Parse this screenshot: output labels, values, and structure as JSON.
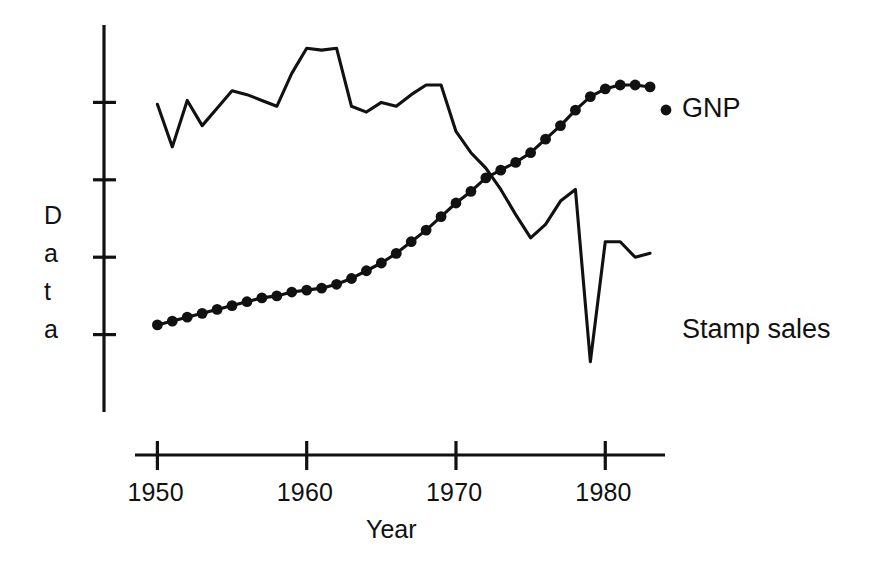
{
  "chart_data": {
    "type": "line",
    "title": "",
    "xlabel": "Year",
    "ylabel": "Data",
    "ylabel_letters": [
      "D",
      "a",
      "t",
      "a"
    ],
    "xlim": [
      1948.5,
      1984.0
    ],
    "ylim": [
      0,
      100
    ],
    "grid": false,
    "legend_position": "right-inline-labels",
    "x_tick_labels": [
      "1950",
      "1960",
      "1970",
      "1980"
    ],
    "x_ticks": [
      1950,
      1960,
      1970,
      1980
    ],
    "y_ticks": [
      80,
      60,
      40,
      20
    ],
    "y_tick_labels": [
      "",
      "",
      "",
      ""
    ],
    "series": [
      {
        "name": "Stamp sales",
        "label": "Stamp sales",
        "marker": "none",
        "line": "solid",
        "x": [
          1950,
          1951,
          1952,
          1953,
          1954,
          1955,
          1956,
          1957,
          1958,
          1959,
          1960,
          1961,
          1962,
          1963,
          1964,
          1965,
          1966,
          1967,
          1968,
          1969,
          1970,
          1971,
          1972,
          1973,
          1974,
          1975,
          1976,
          1977,
          1978,
          1979,
          1980,
          1981,
          1982,
          1983
        ],
        "values": [
          79.5,
          68.5,
          80.5,
          74.0,
          78.5,
          83.0,
          82.0,
          80.5,
          79.0,
          87.5,
          94.0,
          93.5,
          94.0,
          79.0,
          77.5,
          80.0,
          79.0,
          82.0,
          84.5,
          84.5,
          72.5,
          67.0,
          63.0,
          57.5,
          51.0,
          45.0,
          48.5,
          54.5,
          57.5,
          13.0,
          44.0,
          44.0,
          40.0,
          41.0
        ]
      },
      {
        "name": "GNP",
        "label": "GNP",
        "marker": "filled-circle",
        "line": "solid",
        "x": [
          1950,
          1951,
          1952,
          1953,
          1954,
          1955,
          1956,
          1957,
          1958,
          1959,
          1960,
          1961,
          1962,
          1963,
          1964,
          1965,
          1966,
          1967,
          1968,
          1969,
          1970,
          1971,
          1972,
          1973,
          1974,
          1975,
          1976,
          1977,
          1978,
          1979,
          1980,
          1981,
          1982,
          1983
        ],
        "values": [
          22.5,
          23.5,
          24.5,
          25.5,
          26.5,
          27.5,
          28.5,
          29.5,
          30.0,
          31.0,
          31.5,
          32.0,
          33.0,
          34.5,
          36.5,
          38.5,
          41.0,
          44.0,
          47.0,
          50.5,
          54.0,
          57.0,
          60.5,
          62.5,
          64.5,
          67.0,
          70.5,
          74.0,
          78.0,
          81.5,
          83.5,
          84.5,
          84.5,
          84.0
        ]
      }
    ],
    "annotations": [
      {
        "text": "GNP",
        "x": 1984.6,
        "y": 84.0
      },
      {
        "text": "Stamp sales",
        "x": 1984.6,
        "y": 41.0
      }
    ]
  }
}
